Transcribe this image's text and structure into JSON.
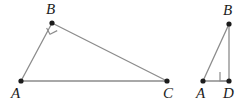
{
  "figure": {
    "background_color": "#ffffff",
    "stroke_color": "#8c8c8c",
    "vertex_color": "#1c1c1c",
    "label_color": "#1c1c1c",
    "stroke_width": 1.3,
    "vertex_radius": 2.6
  },
  "shapes": [
    {
      "name": "triangle-abc",
      "kind": "triangle",
      "vertices": [
        {
          "id": "A",
          "label": "A",
          "x": 21,
          "y": 81,
          "label_x": 11,
          "label_y": 86
        },
        {
          "id": "B",
          "label": "B",
          "x": 52,
          "y": 23,
          "label_x": 46,
          "label_y": 2
        },
        {
          "id": "C",
          "label": "C",
          "x": 167,
          "y": 81,
          "label_x": 163,
          "label_y": 86
        }
      ],
      "edges": [
        {
          "name": "segment-ab",
          "from": "A",
          "to": "B"
        },
        {
          "name": "segment-bc",
          "from": "B",
          "to": "C"
        },
        {
          "name": "segment-ac",
          "from": "A",
          "to": "C"
        }
      ],
      "right_angle": {
        "name": "right-angle-mark-b",
        "at": "B",
        "points": "57.2,30.6 50.0,34.2 46.6,28.0"
      }
    },
    {
      "name": "triangle-abd",
      "kind": "triangle",
      "vertices": [
        {
          "id": "A2",
          "label": "A",
          "x": 203,
          "y": 81,
          "label_x": 196,
          "label_y": 86
        },
        {
          "id": "B2",
          "label": "B",
          "x": 229,
          "y": 24,
          "label_x": 223,
          "label_y": 3
        },
        {
          "id": "D",
          "label": "D",
          "x": 229,
          "y": 81,
          "label_x": 223,
          "label_y": 86
        }
      ],
      "edges": [
        {
          "name": "segment-a2b2",
          "from": "A2",
          "to": "B2"
        },
        {
          "name": "segment-b2d",
          "from": "B2",
          "to": "D"
        },
        {
          "name": "segment-a2d",
          "from": "A2",
          "to": "D"
        }
      ],
      "right_angle": {
        "name": "right-angle-mark-d",
        "at": "D",
        "points": "220,72 220,81 229,81"
      }
    }
  ]
}
